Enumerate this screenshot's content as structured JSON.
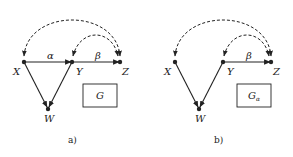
{
  "colors": {
    "ink": "#222222",
    "background": "#ffffff"
  },
  "panels": [
    {
      "caption": "a)",
      "nodes": {
        "X": "X",
        "Y": "Y",
        "Z": "Z",
        "W": "W"
      },
      "edge_labels": {
        "xy": "α",
        "yz": "β"
      },
      "box_label": "G",
      "box_subscript": ""
    },
    {
      "caption": "b)",
      "nodes": {
        "X": "X",
        "Y": "Y",
        "Z": "Z",
        "W": "W"
      },
      "edge_labels": {
        "yz": "β"
      },
      "box_label": "G",
      "box_subscript": "α"
    }
  ]
}
